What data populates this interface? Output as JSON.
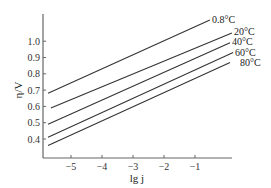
{
  "chart_data": {
    "type": "line",
    "title": "",
    "xlabel": "lg j",
    "ylabel": "η/V",
    "xlim": [
      -5.9,
      1.2
    ],
    "ylim": [
      0.283,
      1.17
    ],
    "grid": false,
    "legend": "inline labels at right end of each line",
    "x_ticks": [
      -5,
      -4,
      -3,
      -2,
      -1
    ],
    "x_tick_labels": [
      "−5",
      "−4",
      "−3",
      "−2",
      "−1"
    ],
    "y_ticks": [
      0.4,
      0.5,
      0.6,
      0.7,
      0.8,
      0.9,
      1.0
    ],
    "y_tick_labels": [
      "0.4",
      "0.5",
      "0.6",
      "0.7",
      "0.8",
      "0.9",
      "1.0"
    ],
    "series": [
      {
        "name": "0.8°C",
        "x": [
          -5.74,
          -0.52
        ],
        "y": [
          0.68,
          1.13
        ]
      },
      {
        "name": "20°C",
        "x": [
          -5.65,
          0.19
        ],
        "y": [
          0.59,
          1.05
        ]
      },
      {
        "name": "40°C",
        "x": [
          -5.74,
          0.13
        ],
        "y": [
          0.49,
          0.99
        ]
      },
      {
        "name": "60°C",
        "x": [
          -5.74,
          0.23
        ],
        "y": [
          0.41,
          0.93
        ]
      },
      {
        "name": "80°C",
        "x": [
          -5.74,
          0.13
        ],
        "y": [
          0.36,
          0.87
        ]
      }
    ]
  },
  "labels": {
    "xlabel": "lg j",
    "ylabel": "η/V",
    "s0": "0.8°C",
    "s1": "20°C",
    "s2": "40°C",
    "s3": "60°C",
    "s4": "80°C"
  }
}
